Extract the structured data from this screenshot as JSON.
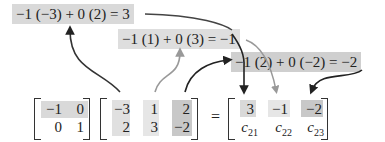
{
  "equations": [
    {
      "text": "−1 (−3) + 0 (2) = 3"
    },
    {
      "text": "−1 (1) + 0 (3) = −1"
    },
    {
      "text": "−1 (2) + 0 (−2) = −2"
    }
  ],
  "matrix_a": {
    "rows": [
      [
        "−1",
        "0"
      ],
      [
        "0",
        "1"
      ]
    ],
    "highlighted_row": 0
  },
  "matrix_b": {
    "rows": [
      [
        "−3",
        "1",
        "2"
      ],
      [
        "2",
        "3",
        "−2"
      ]
    ],
    "highlighted_columns": [
      0,
      1,
      2
    ]
  },
  "equals_sign": "=",
  "matrix_c": {
    "row1": [
      "3",
      "−1",
      "−2"
    ],
    "row2": [
      {
        "letter": "c",
        "sub": "21"
      },
      {
        "letter": "c",
        "sub": "22"
      },
      {
        "letter": "c",
        "sub": "23"
      }
    ]
  },
  "colors": {
    "highlight_dark": "#c8c8c8",
    "highlight_mid": "#d9d9d9",
    "highlight_light": "#e6e6e6",
    "arrow_dark": "#222222",
    "arrow_gray": "#999999"
  }
}
